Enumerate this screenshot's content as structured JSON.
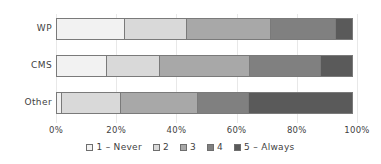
{
  "chart_data": {
    "type": "bar",
    "orientation": "horizontal",
    "stacked": true,
    "normalized": "100%",
    "title": "",
    "subtitle": "",
    "xlabel": "",
    "ylabel": "",
    "categories": [
      "WP",
      "CMS",
      "Other"
    ],
    "series": [
      {
        "name": "1 – Never",
        "color": "#f2f2f2",
        "values": [
          23,
          17,
          2
        ]
      },
      {
        "name": "2",
        "color": "#d9d9d9",
        "values": [
          21,
          18,
          20
        ]
      },
      {
        "name": "3",
        "color": "#a8a8a8",
        "values": [
          28,
          30,
          26
        ]
      },
      {
        "name": "4",
        "color": "#808080",
        "values": [
          22,
          24,
          17
        ]
      },
      {
        "name": "5 – Always",
        "color": "#5a5a5a",
        "values": [
          6,
          11,
          35
        ]
      }
    ],
    "xlim": [
      0,
      100
    ],
    "xticks": [
      0,
      20,
      40,
      60,
      80,
      100
    ],
    "xtick_labels": [
      "0%",
      "20%",
      "40%",
      "60%",
      "80%",
      "100%"
    ],
    "grid": true,
    "grid_axis": "x",
    "legend": {
      "position": "bottom",
      "entries": [
        "1 – Never",
        "2",
        "3",
        "4",
        "5 – Always"
      ]
    }
  },
  "colors": {
    "background": "#ffffff",
    "gridline": "#e8e8e8",
    "bar_border": "#7a7a7a",
    "text": "#3f3f3f"
  }
}
